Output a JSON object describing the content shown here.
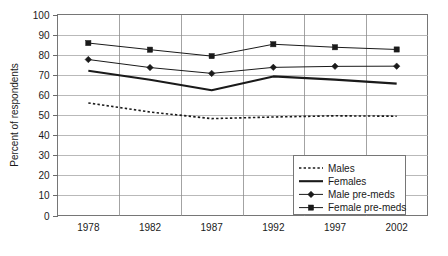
{
  "chart_data": {
    "type": "line",
    "title": "",
    "xlabel": "",
    "ylabel": "Percent of respondents",
    "categories": [
      "1978",
      "1982",
      "1987",
      "1992",
      "1997",
      "2002"
    ],
    "ylim": [
      0,
      100
    ],
    "yticks": [
      0,
      10,
      20,
      30,
      40,
      50,
      60,
      70,
      80,
      90,
      100
    ],
    "grid": true,
    "legend_position": "inside-bottom-right",
    "series": [
      {
        "name": "Males",
        "style": "dashed",
        "marker": "none",
        "color": "#1a1a1a",
        "values": [
          56.0,
          51.5,
          48.2,
          49.0,
          49.6,
          49.4
        ]
      },
      {
        "name": "Females",
        "style": "solid-thick",
        "marker": "none",
        "color": "#1a1a1a",
        "values": [
          72.0,
          67.5,
          62.3,
          69.2,
          67.6,
          65.6
        ]
      },
      {
        "name": "Male pre-meds",
        "style": "solid-thin",
        "marker": "diamond",
        "color": "#1a1a1a",
        "values": [
          77.6,
          73.6,
          70.7,
          73.7,
          74.2,
          74.3
        ]
      },
      {
        "name": "Female pre-meds",
        "style": "solid-thin",
        "marker": "square",
        "color": "#1a1a1a",
        "values": [
          85.8,
          82.5,
          79.3,
          85.2,
          83.7,
          82.6
        ]
      }
    ]
  },
  "legend": {
    "entries": [
      {
        "label": "Males"
      },
      {
        "label": "Females"
      },
      {
        "label": "Male pre-meds"
      },
      {
        "label": "Female pre-meds"
      }
    ]
  }
}
